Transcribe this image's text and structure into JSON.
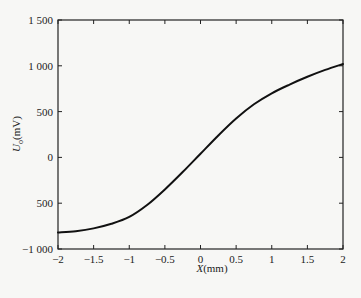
{
  "chart_data": {
    "type": "line",
    "title": "",
    "xlabel": "X(mm)",
    "ylabel": "U_o(mV)",
    "xlabel_parts": {
      "var": "X",
      "unit": "(mm)"
    },
    "ylabel_parts": {
      "var": "U",
      "sub": "o",
      "unit": "(mV)"
    },
    "xlim": [
      -2,
      2
    ],
    "ylim": [
      -1000,
      1500
    ],
    "grid": false,
    "legend": null,
    "x_ticks": [
      -2,
      -1.5,
      -1,
      -0.5,
      0,
      0.5,
      1,
      1.5,
      2
    ],
    "x_tick_labels": [
      "−2",
      "−1.5",
      "−1",
      "−0.5",
      "0",
      "0.5",
      "1",
      "1.5",
      "2"
    ],
    "y_ticks": [
      -1000,
      -500,
      0,
      500,
      1000,
      1500
    ],
    "y_tick_labels": [
      "−1 000",
      "500",
      "0",
      "500",
      "1 000",
      "1 500"
    ],
    "series": [
      {
        "name": "U_o",
        "color": "#111111",
        "x": [
          -2,
          -1.75,
          -1.5,
          -1.25,
          -1,
          -0.75,
          -0.5,
          -0.25,
          0,
          0.25,
          0.5,
          0.75,
          1,
          1.25,
          1.5,
          1.75,
          2
        ],
        "values": [
          -820,
          -805,
          -775,
          -725,
          -650,
          -520,
          -350,
          -160,
          40,
          240,
          425,
          580,
          700,
          795,
          880,
          955,
          1020
        ]
      }
    ]
  }
}
